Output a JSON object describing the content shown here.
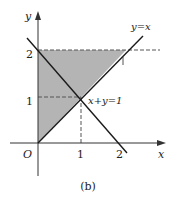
{
  "figure": {
    "caption": "(b)",
    "colors": {
      "shade": "#b4b4b4",
      "line": "#1a1a1a",
      "axis": "#333333",
      "dash": "#555555"
    },
    "axes": {
      "x_label": "x",
      "y_label": "y",
      "origin_label": "O",
      "x_ticks": [
        "1",
        "2"
      ],
      "y_ticks": [
        "1",
        "2"
      ]
    },
    "lines": [
      {
        "label": "y=x",
        "equation": "y = x"
      },
      {
        "label": "x+y=1",
        "equation": "x + y = 2"
      }
    ],
    "shaded_region": {
      "description": "Region bounded by x=0, y=2 and y=x",
      "vertices": [
        [
          0,
          0
        ],
        [
          0,
          2
        ],
        [
          2,
          2
        ]
      ]
    },
    "dashed_guides": [
      {
        "from": [
          0,
          1
        ],
        "to": [
          1,
          1
        ]
      },
      {
        "from": [
          1,
          1
        ],
        "to": [
          1,
          0
        ]
      },
      {
        "from": [
          0,
          2
        ],
        "to": [
          2,
          2
        ]
      },
      {
        "from": [
          2,
          2
        ],
        "to": [
          2,
          1.75
        ]
      }
    ],
    "intersection_point": [
      1,
      1
    ]
  }
}
